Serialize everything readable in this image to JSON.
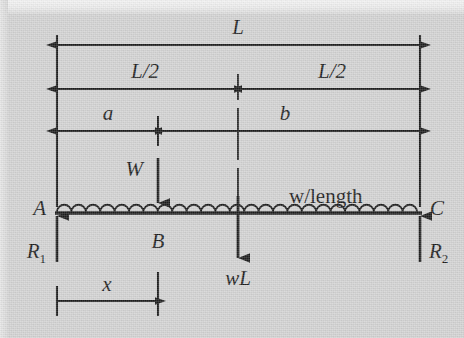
{
  "figure": {
    "type": "beam-free-body-diagram",
    "background_color": "#d2d2d2",
    "ink_color": "#1b1b1b"
  },
  "dimensions": {
    "overall": {
      "label": "L",
      "from": "A",
      "to": "C"
    },
    "half_left": {
      "label": "L/2",
      "from": "A",
      "to": "midspan"
    },
    "half_right": {
      "label": "L/2",
      "from": "midspan",
      "to": "C"
    },
    "a": {
      "label": "a",
      "from": "A",
      "to": "B"
    },
    "b": {
      "label": "b",
      "from": "B",
      "to": "C"
    },
    "x": {
      "label": "x",
      "from": "A",
      "to": "B"
    }
  },
  "nodes": {
    "left": "A",
    "load_point": "B",
    "right": "C"
  },
  "loads": {
    "point_load": "W",
    "distributed_load": "w/length",
    "distributed_resultant": "wL"
  },
  "reactions": {
    "left": {
      "symbol": "R",
      "subscript": "1"
    },
    "right": {
      "symbol": "R",
      "subscript": "2"
    }
  }
}
